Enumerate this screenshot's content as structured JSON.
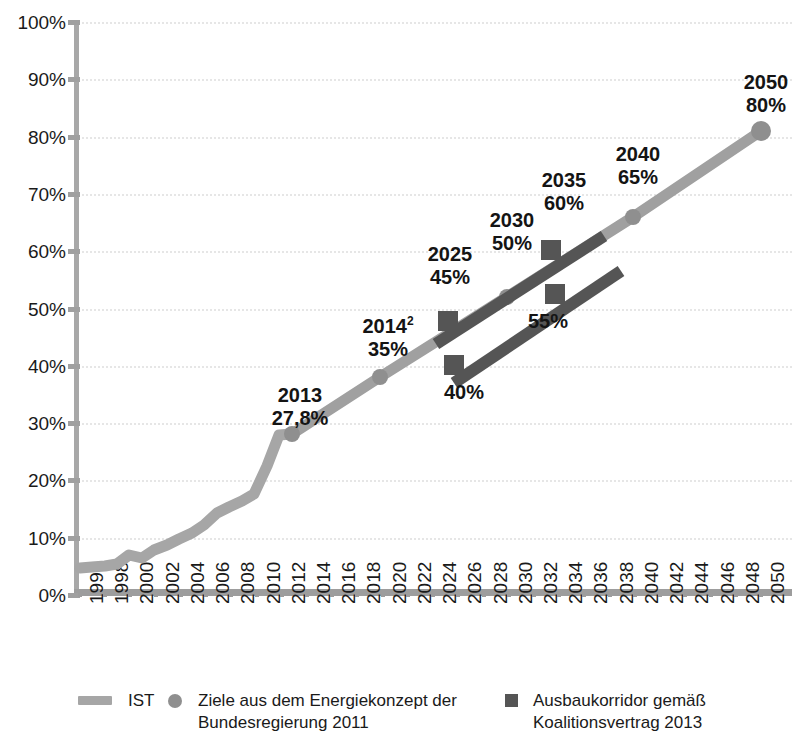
{
  "chart_data": {
    "type": "line",
    "title": "",
    "xlabel": "",
    "ylabel": "",
    "xlim": [
      1995,
      2051
    ],
    "ylim": [
      0,
      100
    ],
    "grid": true,
    "legend_position": "bottom",
    "y_ticks": [
      "0%",
      "10%",
      "20%",
      "30%",
      "40%",
      "50%",
      "60%",
      "70%",
      "80%",
      "90%",
      "100%"
    ],
    "y_tick_values": [
      0,
      10,
      20,
      30,
      40,
      50,
      60,
      70,
      80,
      90,
      100
    ],
    "x_ticks": [
      "1996",
      "1998",
      "2000",
      "2002",
      "2004",
      "2006",
      "2008",
      "2010",
      "2012",
      "2014",
      "2016",
      "2018",
      "2020",
      "2022",
      "2024",
      "2026",
      "2028",
      "2030",
      "2032",
      "2034",
      "2036",
      "2038",
      "2040",
      "2042",
      "2044",
      "2046",
      "2048",
      "2050"
    ],
    "series": [
      {
        "name": "IST",
        "type": "line",
        "color": "#a6a6a6",
        "x": [
          1996,
          1997,
          1998,
          1999,
          2000,
          2001,
          2002,
          2003,
          2004,
          2005,
          2006,
          2007,
          2008,
          2009,
          2010,
          2011,
          2012,
          2013
        ],
        "values": [
          4.7,
          4.8,
          5.0,
          5.4,
          7.0,
          6.5,
          7.8,
          8.6,
          9.8,
          10.8,
          12.2,
          14.3,
          15.3,
          16.5,
          17.6,
          22.5,
          28.0,
          27.8
        ]
      },
      {
        "name": "Ziele aus dem Energiekonzept der Bundesregierung 2011",
        "type": "line-markers",
        "color": "#a6a6a6",
        "x": [
          2013,
          2020,
          2030,
          2040,
          2050
        ],
        "values": [
          27.8,
          38.0,
          52.0,
          66.0,
          81.0
        ],
        "marker": "circle"
      },
      {
        "name": "Ausbaukorridor gemäß Koalitionsvertrag 2013 (oberer Korridor)",
        "type": "band",
        "color": "#555555",
        "x": [
          2022.2,
          2035.6
        ],
        "values": [
          43.8,
          62.6
        ],
        "markers": [
          {
            "x": 2024.6,
            "y": 47.8,
            "label": "45%"
          },
          {
            "x": 2032.6,
            "y": 60.2,
            "label": "60%"
          }
        ]
      },
      {
        "name": "Ausbaukorridor gemäß Koalitionsvertrag 2013 (unterer Korridor)",
        "type": "band",
        "color": "#555555",
        "x": [
          2023.6,
          2036.8
        ],
        "values": [
          37.2,
          57.2
        ],
        "markers": [
          {
            "x": 2025.0,
            "y": 40.2,
            "label": "40%"
          },
          {
            "x": 2032.9,
            "y": 52.6,
            "label": "55%"
          }
        ]
      }
    ],
    "annotations": [
      {
        "id": "ann-2013",
        "year": "2013",
        "value": "27,8%",
        "superscript": ""
      },
      {
        "id": "ann-2014",
        "year": "2014",
        "value": "35%",
        "superscript": "2"
      },
      {
        "id": "ann-2025",
        "year": "2025",
        "value": "45%",
        "superscript": ""
      },
      {
        "id": "ann-2030",
        "year": "2030",
        "value": "50%",
        "superscript": ""
      },
      {
        "id": "ann-2035",
        "year": "2035",
        "value": "60%",
        "superscript": ""
      },
      {
        "id": "ann-2040",
        "year": "2040",
        "value": "65%",
        "superscript": ""
      },
      {
        "id": "ann-2050",
        "year": "2050",
        "value": "80%",
        "superscript": ""
      },
      {
        "id": "ann-40",
        "year": "",
        "value": "40%",
        "superscript": ""
      },
      {
        "id": "ann-55",
        "year": "",
        "value": "55%",
        "superscript": ""
      }
    ],
    "legend": [
      {
        "label": "IST",
        "marker": "line",
        "color": "#a6a6a6"
      },
      {
        "label": "Ziele aus dem Energiekonzept der\nBundesregierung 2011",
        "marker": "circle",
        "color": "#8f8f8f"
      },
      {
        "label": "Ausbaukorridor gemäß\nKoalitionsvertrag 2013",
        "marker": "square",
        "color": "#555555"
      }
    ]
  },
  "axis": {
    "y_labels": [
      "100%",
      "90%",
      "80%",
      "70%",
      "60%",
      "50%",
      "40%",
      "30%",
      "20%",
      "10%",
      "0%"
    ],
    "x_labels": [
      "1996",
      "1998",
      "2000",
      "2002",
      "2004",
      "2006",
      "2008",
      "2010",
      "2012",
      "2014",
      "2016",
      "2018",
      "2020",
      "2022",
      "2024",
      "2026",
      "2028",
      "2030",
      "2032",
      "2034",
      "2036",
      "2038",
      "2040",
      "2042",
      "2044",
      "2046",
      "2048",
      "2050"
    ]
  },
  "annotation_text": {
    "a2013_year": "2013",
    "a2013_val": "27,8%",
    "a2014_year": "2014",
    "a2014_sup": "2",
    "a2014_val": "35%",
    "a2025_year": "2025",
    "a2025_val": "45%",
    "a2030_year": "2030",
    "a2030_val": "50%",
    "a2035_year": "2035",
    "a2035_val": "60%",
    "a2040_year": "2040",
    "a2040_val": "65%",
    "a2050_year": "2050",
    "a2050_val": "80%",
    "a40_val": "40%",
    "a55_val": "55%"
  },
  "legend_text": {
    "ist": "IST",
    "ziele_l1": "Ziele aus dem Energiekonzept der",
    "ziele_l2": "Bundesregierung 2011",
    "korridor_l1": "Ausbaukorridor gemäß",
    "korridor_l2": "Koalitionsvertrag 2013"
  },
  "colors": {
    "ist_line": "#a6a6a6",
    "ziele_line": "#a0a0a0",
    "korridor_band": "#555555",
    "grid": "#e6e6e6",
    "axis": "#9d9d9d",
    "text": "#1a1a1a"
  }
}
